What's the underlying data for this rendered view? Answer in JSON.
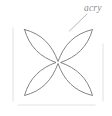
{
  "figure": {
    "title_label": "acry",
    "label_is_clipped": true,
    "background_color": "#ffffff",
    "stroke_color": "#6e6e6e",
    "guide_color": "#ededed",
    "label_color": "#8e8e8e",
    "shape": {
      "name": "quatrefoil-four-petal-outline",
      "petal_count": 4,
      "bounds": {
        "x": 24,
        "y": 29,
        "width": 69,
        "height": 67
      },
      "center": {
        "x": 58,
        "y": 62
      }
    },
    "leader_line": {
      "name": "annotation-leader-line",
      "from": {
        "x": 87,
        "y": 14
      },
      "to": {
        "x": 69,
        "y": 31
      }
    },
    "guides": [
      {
        "name": "left-guide-line",
        "x1": 13,
        "y1": 28,
        "x2": 13,
        "y2": 101
      },
      {
        "name": "right-guide-line",
        "x1": 103,
        "y1": 44,
        "x2": 103,
        "y2": 101
      },
      {
        "name": "bottom-guide-line",
        "x1": 18,
        "y1": 105,
        "x2": 95,
        "y2": 105
      }
    ]
  }
}
